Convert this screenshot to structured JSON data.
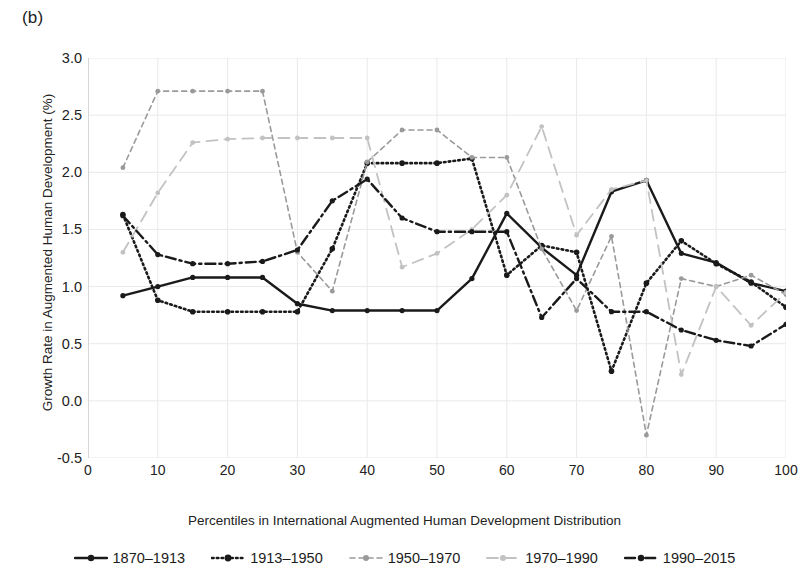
{
  "panel": {
    "label": "(b)"
  },
  "axes": {
    "ylabel": "Growth Rate in Augmented Human Development (%)",
    "xlabel": "Percentiles in International Augmented Human Development Distribution",
    "yticks": [
      "3.0",
      "2.5",
      "2.0",
      "1.5",
      "1.0",
      "0.5",
      "0.0",
      "-0.5"
    ],
    "xticks": [
      "0",
      "10",
      "20",
      "30",
      "40",
      "50",
      "60",
      "70",
      "80",
      "90",
      "100"
    ]
  },
  "legend": {
    "items": [
      {
        "label": "1870–1913",
        "style": "solid",
        "color": "#1a1a1a"
      },
      {
        "label": "1913–1950",
        "style": "dotted",
        "color": "#1a1a1a"
      },
      {
        "label": "1950–1970",
        "style": "dashed",
        "color": "#9a9a9a"
      },
      {
        "label": "1970–1990",
        "style": "longdash",
        "color": "#c2c2c2"
      },
      {
        "label": "1990–2015",
        "style": "dashdot",
        "color": "#1a1a1a"
      }
    ]
  },
  "chart_data": {
    "type": "line",
    "title": "(b)",
    "xlabel": "Percentiles in International Augmented Human Development Distribution",
    "ylabel": "Growth Rate in Augmented Human Development (%)",
    "xlim": [
      0,
      100
    ],
    "ylim": [
      -0.5,
      3.0
    ],
    "ytick_step": 0.5,
    "xtick_step": 10,
    "grid": true,
    "legend_position": "bottom",
    "x": [
      5,
      10,
      15,
      20,
      25,
      30,
      35,
      40,
      45,
      50,
      55,
      60,
      65,
      70,
      75,
      80,
      85,
      90,
      95,
      100
    ],
    "series": [
      {
        "name": "1870–1913",
        "color": "#1a1a1a",
        "style": "solid",
        "values": [
          0.92,
          1.0,
          1.08,
          1.08,
          1.08,
          0.85,
          0.79,
          0.79,
          0.79,
          0.79,
          1.07,
          1.64,
          1.34,
          1.1,
          1.83,
          1.93,
          1.29,
          1.21,
          1.03,
          0.96
        ]
      },
      {
        "name": "1913–1950",
        "color": "#1a1a1a",
        "style": "dotted",
        "values": [
          1.63,
          0.88,
          0.78,
          0.78,
          0.78,
          0.78,
          1.33,
          2.08,
          2.08,
          2.08,
          2.12,
          1.1,
          1.36,
          1.3,
          0.26,
          1.03,
          1.4,
          1.2,
          1.04,
          0.82
        ]
      },
      {
        "name": "1950–1970",
        "color": "#9a9a9a",
        "style": "dashed",
        "values": [
          2.04,
          2.71,
          2.71,
          2.71,
          2.71,
          1.3,
          0.96,
          2.09,
          2.37,
          2.37,
          2.13,
          2.13,
          1.33,
          0.79,
          1.44,
          -0.3,
          1.07,
          1.0,
          1.1,
          0.93
        ]
      },
      {
        "name": "1970–1990",
        "color": "#c2c2c2",
        "style": "longdash",
        "values": [
          1.3,
          1.82,
          2.26,
          2.29,
          2.3,
          2.3,
          2.3,
          2.3,
          1.17,
          1.29,
          1.5,
          1.8,
          2.4,
          1.45,
          1.85,
          1.93,
          0.23,
          1.0,
          0.66,
          0.95
        ]
      },
      {
        "name": "1990–2015",
        "color": "#1a1a1a",
        "style": "dashdot",
        "values": [
          1.62,
          1.28,
          1.2,
          1.2,
          1.22,
          1.32,
          1.75,
          1.94,
          1.6,
          1.48,
          1.48,
          1.48,
          0.73,
          1.07,
          0.78,
          0.78,
          0.62,
          0.53,
          0.48,
          0.67
        ]
      }
    ]
  }
}
